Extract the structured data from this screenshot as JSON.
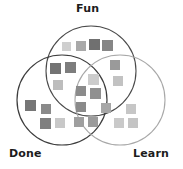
{
  "diagram": {
    "type": "venn",
    "title": "",
    "background": "#ffffff",
    "sets": [
      {
        "id": "fun",
        "label": "Fun",
        "cx": 91,
        "cy": 71,
        "r": 45,
        "stroke": "#4a4a4a",
        "stroke_width": 1.1,
        "label_x": 76,
        "label_y": 3
      },
      {
        "id": "done",
        "label": "Done",
        "cx": 62,
        "cy": 100,
        "r": 45,
        "stroke": "#3d3d3d",
        "stroke_width": 1.2,
        "label_x": 9,
        "label_y": 148
      },
      {
        "id": "learn",
        "label": "Learn",
        "cx": 120,
        "cy": 100,
        "r": 45,
        "stroke": "#a8a8a8",
        "stroke_width": 1.1,
        "label_x": 133,
        "label_y": 148
      }
    ],
    "palette": {
      "dark": "#6f6f6f",
      "mid": "#8d8d8d",
      "light": "#b4b4b4",
      "pale": "#d2d2d2"
    },
    "squares": [
      {
        "region": "fun",
        "x": 62,
        "y": 42,
        "size": 9,
        "fill": "#cfcfcf"
      },
      {
        "region": "fun",
        "x": 76,
        "y": 41,
        "size": 10,
        "fill": "#a9a9a9"
      },
      {
        "region": "fun",
        "x": 89,
        "y": 39,
        "size": 11,
        "fill": "#707070"
      },
      {
        "region": "fun",
        "x": 102,
        "y": 40,
        "size": 11,
        "fill": "#868686"
      },
      {
        "region": "fun-done",
        "x": 50,
        "y": 63,
        "size": 11,
        "fill": "#737373"
      },
      {
        "region": "fun-done",
        "x": 65,
        "y": 62,
        "size": 11,
        "fill": "#7d7d7d"
      },
      {
        "region": "fun-done",
        "x": 53,
        "y": 80,
        "size": 10,
        "fill": "#bdbdbd"
      },
      {
        "region": "fun-learn",
        "x": 110,
        "y": 60,
        "size": 10,
        "fill": "#9a9a9a"
      },
      {
        "region": "fun-learn",
        "x": 113,
        "y": 76,
        "size": 10,
        "fill": "#c2c2c2"
      },
      {
        "region": "center",
        "x": 88,
        "y": 74,
        "size": 11,
        "fill": "#cccccc"
      },
      {
        "region": "center",
        "x": 76,
        "y": 86,
        "size": 10,
        "fill": "#8b8b8b"
      },
      {
        "region": "center",
        "x": 90,
        "y": 88,
        "size": 11,
        "fill": "#909090"
      },
      {
        "region": "center",
        "x": 76,
        "y": 102,
        "size": 10,
        "fill": "#8a8a8a"
      },
      {
        "region": "done",
        "x": 25,
        "y": 100,
        "size": 11,
        "fill": "#767676"
      },
      {
        "region": "done",
        "x": 41,
        "y": 104,
        "size": 10,
        "fill": "#8a8a8a"
      },
      {
        "region": "done",
        "x": 40,
        "y": 118,
        "size": 11,
        "fill": "#7f7f7f"
      },
      {
        "region": "done",
        "x": 55,
        "y": 118,
        "size": 10,
        "fill": "#c8c8c8"
      },
      {
        "region": "done-learn",
        "x": 74,
        "y": 117,
        "size": 10,
        "fill": "#9f9f9f"
      },
      {
        "region": "done-learn",
        "x": 88,
        "y": 117,
        "size": 10,
        "fill": "#9b9b9b"
      },
      {
        "region": "done-learn",
        "x": 101,
        "y": 103,
        "size": 10,
        "fill": "#a6a6a6"
      },
      {
        "region": "learn",
        "x": 126,
        "y": 104,
        "size": 10,
        "fill": "#c6c6c6"
      },
      {
        "region": "learn",
        "x": 114,
        "y": 118,
        "size": 10,
        "fill": "#c9c9c9"
      },
      {
        "region": "learn",
        "x": 128,
        "y": 118,
        "size": 10,
        "fill": "#c4c4c4"
      }
    ]
  }
}
